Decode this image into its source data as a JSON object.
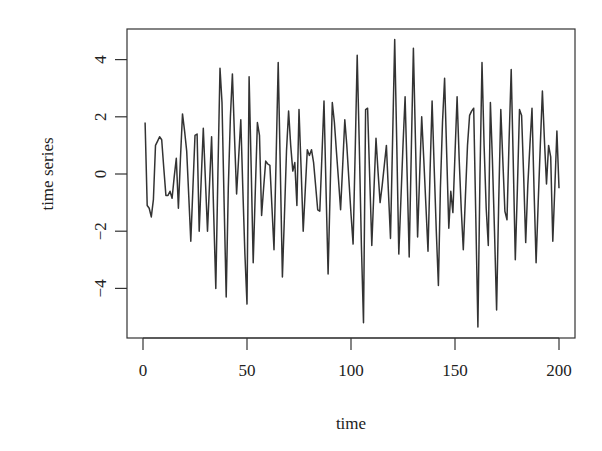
{
  "chart_data": {
    "type": "line",
    "title": "",
    "xlabel": "time",
    "ylabel": "time series",
    "xlim": [
      1,
      200
    ],
    "ylim": [
      -5.4,
      4.8
    ],
    "grid": false,
    "legend": null,
    "x_ticks": [
      0,
      50,
      100,
      150,
      200
    ],
    "x_tick_labels": [
      "0",
      "50",
      "100",
      "150",
      "200"
    ],
    "y_ticks": [
      -4,
      -2,
      0,
      2,
      4
    ],
    "y_tick_labels": [
      "−4",
      "−2",
      "0",
      "2",
      "4"
    ],
    "line_color": "#333333",
    "series": [
      {
        "name": "time series",
        "x_start": 1,
        "x_step": 1,
        "values": [
          1.8,
          -1.1,
          -1.2,
          -1.5,
          -0.9,
          1.0,
          1.15,
          1.3,
          1.2,
          0.2,
          -0.75,
          -0.75,
          -0.6,
          -0.85,
          -0.1,
          0.55,
          -1.2,
          0.5,
          2.1,
          1.5,
          0.8,
          -0.8,
          -2.35,
          -0.5,
          1.35,
          1.4,
          -2.0,
          -0.2,
          1.6,
          -0.2,
          -2.0,
          -0.3,
          1.3,
          -1.4,
          -4.0,
          0.0,
          3.7,
          2.5,
          -1.0,
          -4.3,
          -0.5,
          2.0,
          3.5,
          1.3,
          -0.7,
          0.6,
          1.9,
          -0.5,
          -2.8,
          -4.55,
          3.4,
          0.2,
          -3.1,
          -0.6,
          1.8,
          1.35,
          -1.45,
          -0.5,
          0.45,
          0.35,
          0.3,
          -1.2,
          -2.65,
          0.5,
          3.9,
          0.2,
          -3.6,
          -1.5,
          0.8,
          2.2,
          1.0,
          0.1,
          0.4,
          -1.1,
          2.25,
          0.2,
          -2.0,
          -0.6,
          0.85,
          0.65,
          0.85,
          0.4,
          -0.4,
          -1.25,
          -1.3,
          0.6,
          2.55,
          -0.5,
          -3.5,
          -0.5,
          2.5,
          1.8,
          0.8,
          -0.2,
          -1.25,
          0.3,
          1.9,
          1.0,
          -0.2,
          -1.4,
          -2.45,
          0.8,
          4.15,
          1.0,
          -2.5,
          -5.2,
          2.25,
          2.3,
          -0.1,
          -2.5,
          -0.6,
          1.25,
          0.1,
          -1.0,
          -0.4,
          0.3,
          1.0,
          -0.6,
          -2.25,
          1.2,
          4.7,
          1.0,
          -2.8,
          -0.9,
          1.0,
          2.7,
          -0.1,
          -2.9,
          0.8,
          4.4,
          1.1,
          -2.2,
          -0.1,
          2.0,
          0.5,
          -1.1,
          -2.7,
          0.0,
          2.55,
          0.2,
          -2.0,
          -3.9,
          -0.5,
          1.8,
          3.35,
          0.7,
          -1.9,
          -0.6,
          -1.35,
          0.7,
          2.7,
          0.5,
          -1.2,
          -2.65,
          -0.8,
          1.0,
          2.05,
          2.2,
          2.3,
          -1.5,
          -5.35,
          0.0,
          3.9,
          1.0,
          -1.2,
          -2.5,
          2.5,
          0.5,
          -2.0,
          -4.75,
          -1.0,
          2.25,
          0.5,
          -1.3,
          -1.6,
          1.2,
          3.65,
          0.5,
          -3.0,
          -0.5,
          2.25,
          2.05,
          0.0,
          -2.4,
          -0.4,
          1.0,
          2.3,
          -0.5,
          -3.1,
          -1.0,
          1.0,
          2.9,
          1.2,
          -0.35,
          1.0,
          0.6,
          -2.35,
          -0.5,
          1.5,
          -0.5
        ]
      }
    ]
  },
  "layout": {
    "plot_left": 127,
    "plot_right": 575,
    "plot_top": 29,
    "plot_bottom": 338,
    "x0_px": 143,
    "x_px_per_unit": 2.08,
    "y0_px": 174,
    "y_px_per_unit": 28.6
  }
}
